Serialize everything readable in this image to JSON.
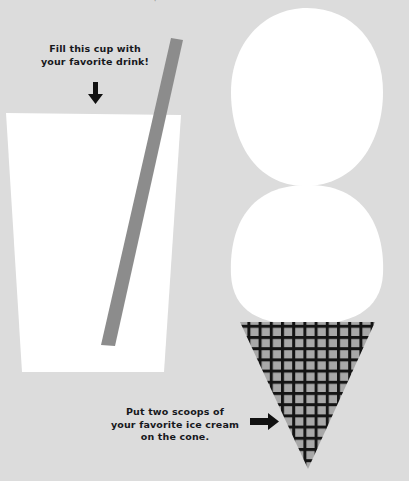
{
  "page": {
    "background_color": "#dcdcdc",
    "width": 409,
    "height": 481,
    "top_cropped_mark": "✦"
  },
  "colors": {
    "background": "#dcdcdc",
    "paper_white": "#ffffff",
    "straw_gray": "#8c8c8c",
    "cone_fill": "#a8a8a8",
    "cone_grid": "#141414",
    "text": "#17181c",
    "arrow": "#111111"
  },
  "instructions": [
    {
      "id": "cup",
      "text": "Fill this cup with\nyour favorite drink!",
      "lines": [
        "Fill this cup with",
        "your favorite drink!"
      ],
      "arrow": "arrow-down-icon",
      "arrow_direction": "down"
    },
    {
      "id": "cone",
      "text": "Put two scoops of\nyour favorite ice cream\non the cone.",
      "lines": [
        "Put two scoops of",
        "your favorite ice cream",
        "on the cone."
      ],
      "arrow": "arrow-right-icon",
      "arrow_direction": "right"
    }
  ],
  "shapes": {
    "cup": {
      "name": "drinking-cup",
      "fill": "#ffffff",
      "description": "tapered cup outline, wide at the rim, narrow at the base"
    },
    "straw": {
      "name": "drinking-straw",
      "fill": "#8c8c8c",
      "description": "gray straw angled from upper right into the cup"
    },
    "scoops": {
      "name": "ice-cream-scoops",
      "count": 2,
      "fill": "#ffffff",
      "description": "two stacked round scoops of ice cream"
    },
    "cone": {
      "name": "waffle-cone",
      "fill": "#a8a8a8",
      "grid_color": "#141414",
      "description": "downward pointing triangular waffle cone with crosshatch grid"
    }
  }
}
